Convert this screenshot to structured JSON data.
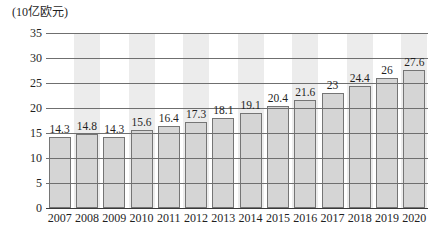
{
  "chart_data": {
    "type": "bar",
    "title": "",
    "unit_label": "(10亿欧元)",
    "xlabel": "",
    "ylabel": "(10亿欧元)",
    "categories": [
      "2007",
      "2008",
      "2009",
      "2010",
      "2011",
      "2012",
      "2013",
      "2014",
      "2015",
      "2016",
      "2017",
      "2018",
      "2019",
      "2020"
    ],
    "values": [
      14.3,
      14.8,
      14.3,
      15.6,
      16.4,
      17.3,
      18.1,
      19.1,
      20.4,
      21.6,
      23,
      24.4,
      26,
      27.6
    ],
    "value_labels": [
      "14.3",
      "14.8",
      "14.3",
      "15.6",
      "16.4",
      "17.3",
      "18.1",
      "19.1",
      "20.4",
      "21.6",
      "23",
      "24.4",
      "26",
      "27.6"
    ],
    "ylim": [
      0,
      35
    ],
    "y_ticks": [
      35,
      30,
      25,
      20,
      15,
      10,
      5,
      0
    ],
    "grid": true,
    "legend": "none",
    "striped_categories": [
      "2008",
      "2010",
      "2012",
      "2014",
      "2016",
      "2018",
      "2020"
    ],
    "colors": {
      "background": "#ffffff",
      "bar_fill": "#d5d5d5",
      "bar_border": "#757575",
      "stripe": "#ececec",
      "gridline": "#6f6f6f",
      "axis": "#3a3a3a",
      "text": "#1f1f1f"
    }
  }
}
